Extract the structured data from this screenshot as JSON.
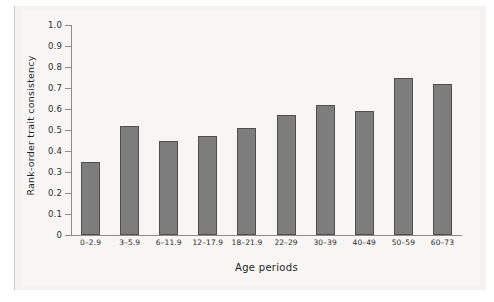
{
  "chart_data": {
    "type": "bar",
    "title": "",
    "xlabel": "Age periods",
    "ylabel": "Rank-order trait consistency",
    "categories": [
      "0–2.9",
      "3–5.9",
      "6–11.9",
      "12–17.9",
      "18–21.9",
      "22–29",
      "30–39",
      "40–49",
      "50–59",
      "60–73"
    ],
    "values": [
      0.35,
      0.52,
      0.45,
      0.47,
      0.51,
      0.57,
      0.62,
      0.59,
      0.75,
      0.72
    ],
    "ylim": [
      0,
      1.0
    ],
    "ytick_labels": [
      "1.0",
      "0.9",
      "0.8",
      "0.7",
      "0.6",
      "0.5",
      "0.4",
      "0.3",
      "0.2",
      "0.1",
      "0"
    ],
    "ytick_values": [
      1.0,
      0.9,
      0.8,
      0.7,
      0.6,
      0.5,
      0.4,
      0.3,
      0.2,
      0.1,
      0.0
    ],
    "grid": false,
    "legend": "none",
    "bar_color": "#7d7d7d",
    "bar_border_color": "#4f4f4f",
    "background_color": "#f7f6f4",
    "axis_color": "#8d8b88",
    "text_color": "#1f1f1f"
  }
}
